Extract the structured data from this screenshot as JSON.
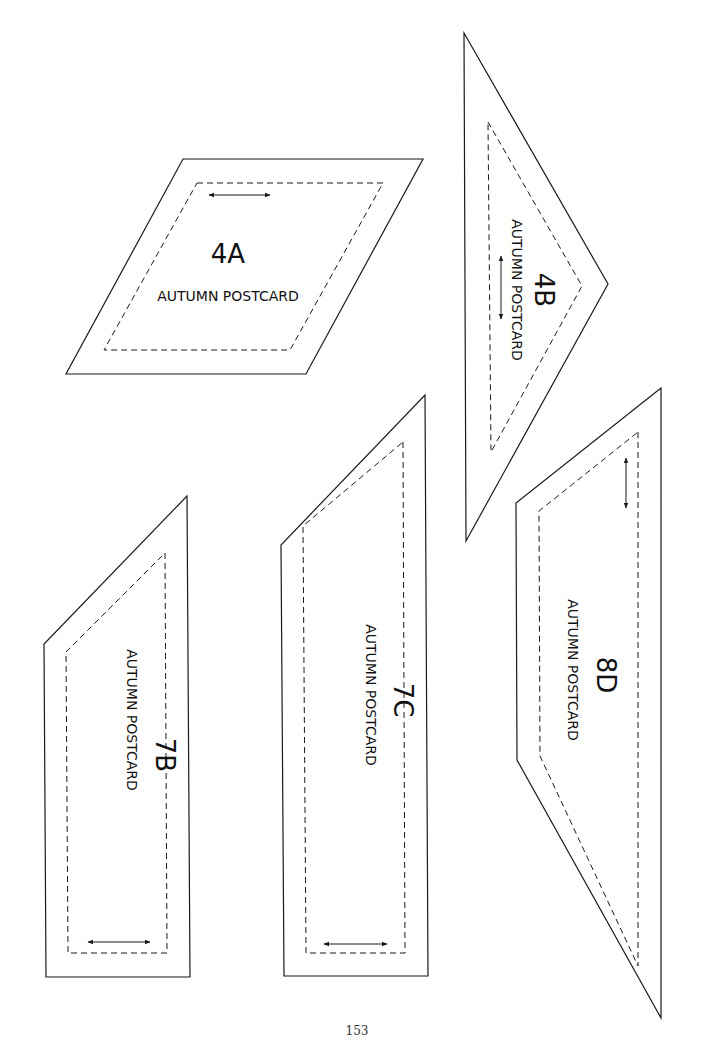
{
  "page_number": "153",
  "pieces": [
    {
      "id": "4A",
      "code": "4A",
      "name": "AUTUMN POSTCARD",
      "shape": "parallelogram",
      "text_rotation": 0
    },
    {
      "id": "4B",
      "code": "4B",
      "name": "AUTUMN POSTCARD",
      "shape": "triangle",
      "text_rotation": 90
    },
    {
      "id": "7B",
      "code": "7B",
      "name": "AUTUMN POSTCARD",
      "shape": "angled-trapezoid",
      "text_rotation": 90
    },
    {
      "id": "7C",
      "code": "7C",
      "name": "AUTUMN POSTCARD",
      "shape": "angled-trapezoid",
      "text_rotation": 90
    },
    {
      "id": "8D",
      "code": "8D",
      "name": "AUTUMN POSTCARD",
      "shape": "trapezoid",
      "text_rotation": 90
    }
  ],
  "legend": {
    "solid_line": "cutting line",
    "dashed_line": "sewing line",
    "double_arrow": "grain line"
  },
  "colors": {
    "line": "#1a1a1a",
    "background": "#ffffff"
  }
}
